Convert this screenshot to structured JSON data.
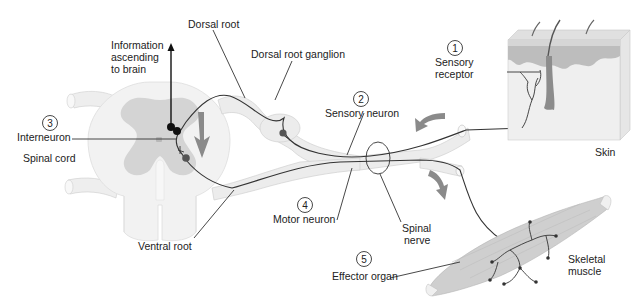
{
  "diagram": {
    "colors": {
      "background": "#ffffff",
      "cord_white_matter": "#f2f2f2",
      "cord_gray_matter": "#d4d4d4",
      "nerve_fill": "#ececec",
      "neuron_line": "#333333",
      "arrow_gray": "#8a8a8a",
      "skin_epidermis": "#bdbdbd",
      "skin_dermis": "#ececec",
      "muscle": "#cfcfcf",
      "text": "#222222"
    },
    "steps": [
      {
        "number": "1",
        "label_lines": [
          "Sensory",
          "receptor"
        ]
      },
      {
        "number": "2",
        "label_lines": [
          "Sensory neuron"
        ]
      },
      {
        "number": "3",
        "label_lines": [
          "Interneuron"
        ]
      },
      {
        "number": "4",
        "label_lines": [
          "Motor neuron"
        ]
      },
      {
        "number": "5",
        "label_lines": [
          "Effector organ"
        ]
      }
    ],
    "labels": {
      "dorsal_root": "Dorsal root",
      "dorsal_root_ganglion": "Dorsal root ganglion",
      "information_ascending": [
        "Information",
        "ascending",
        "to brain"
      ],
      "spinal_cord": "Spinal cord",
      "ventral_root": "Ventral root",
      "spinal_nerve": [
        "Spinal",
        "nerve"
      ],
      "skin": "Skin",
      "skeletal_muscle": [
        "Skeletal",
        "muscle"
      ]
    }
  }
}
